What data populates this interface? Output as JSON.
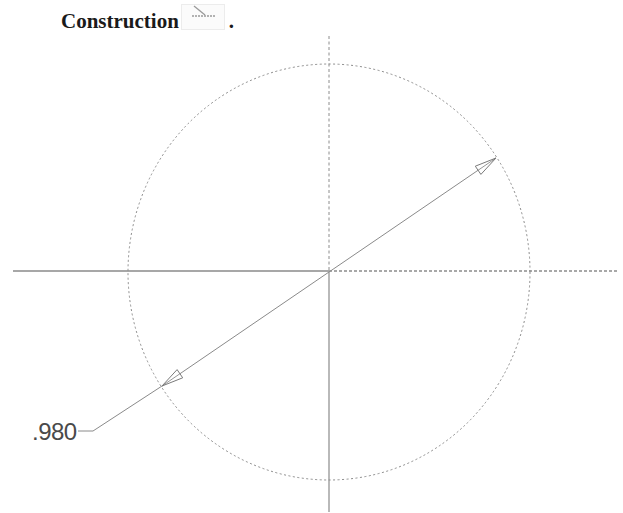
{
  "caption": {
    "text": "Construction",
    "icon": "construction-toggle-icon",
    "trailing": "."
  },
  "sketch": {
    "circle": {
      "center": [
        329,
        272
      ],
      "rx": 201,
      "ry": 208,
      "style": "dashed-construction"
    },
    "horizontal_axis": {
      "left_segment": "solid",
      "right_segment": "dashed",
      "y": 271,
      "x_start": 13,
      "x_end": 617
    },
    "vertical_axis": {
      "upper_segment": "dashed",
      "lower_segment": "solid",
      "x": 329,
      "y_start": 36,
      "y_end": 512
    },
    "dimension": {
      "type": "diameter",
      "value": ".980",
      "arrow_tip_upper": [
        496,
        158
      ],
      "arrow_tip_lower": [
        162,
        386
      ],
      "arrowheads": "open-triangle"
    }
  },
  "colors": {
    "line": "#8a8a8a",
    "dashed": "#8c8c8c",
    "text": "#1a1a1a",
    "dimension_text": "#4a4a4a"
  }
}
